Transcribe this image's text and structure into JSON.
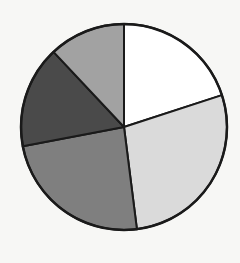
{
  "chart_data": {
    "type": "pie",
    "title": "",
    "categories": [
      "Slice 1",
      "Slice 2",
      "Slice 3",
      "Slice 4",
      "Slice 5"
    ],
    "values": [
      20,
      28,
      24,
      16,
      12
    ],
    "colors": [
      "#ffffff",
      "#dadada",
      "#7f7f7f",
      "#4a4a4a",
      "#a2a2a2"
    ],
    "start_angle_deg": 0,
    "direction": "clockwise",
    "legend": false,
    "labels_shown": false,
    "center": [
      124,
      127
    ],
    "radius": 103,
    "stroke_color": "#1a1a1a"
  }
}
